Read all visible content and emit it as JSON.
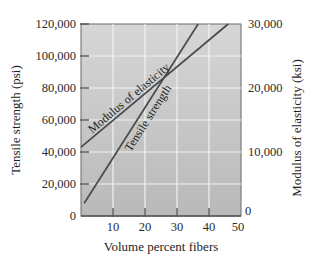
{
  "chart_data": {
    "type": "line",
    "title": "",
    "xlabel": "Volume percent fibers",
    "ylabel": "Tensile strength (psi)",
    "y2label": "Modulus of elasticity (ksi)",
    "xlim": [
      0,
      50
    ],
    "ylim": [
      0,
      120000
    ],
    "y2lim": [
      0,
      30000
    ],
    "x_ticks": [
      10,
      20,
      30,
      40,
      50
    ],
    "y_ticks": [
      0,
      20000,
      40000,
      60000,
      80000,
      100000,
      120000
    ],
    "y_tick_labels": [
      "0",
      "20,000",
      "40,000",
      "60,000",
      "80,000",
      "100,000",
      "120,000"
    ],
    "y2_ticks": [
      0,
      10000,
      20000,
      30000
    ],
    "y2_tick_labels": [
      "0",
      "10,000",
      "20,000",
      "30,000"
    ],
    "grid": true,
    "legend": "none (inline line labels)",
    "series": [
      {
        "name": "Tensile strength",
        "axis": "left",
        "unit": "psi",
        "x": [
          1,
          36.6
        ],
        "y": [
          8000,
          120000
        ]
      },
      {
        "name": "Modulus of elasticity",
        "axis": "right",
        "unit": "ksi",
        "x": [
          0,
          46
        ],
        "y": [
          10750,
          30000
        ]
      }
    ],
    "annotations": [
      {
        "text": "Modulus of elasticity",
        "along": "Modulus of elasticity"
      },
      {
        "text": "Tensile strength",
        "along": "Tensile strength"
      }
    ]
  },
  "style": {
    "plot_bg_top": "#d6d6d6",
    "plot_bg_bottom": "#b9b9b9",
    "grid_color": "#f2f2f2",
    "line_color": "#4a4a4a",
    "axis_color": "#555555"
  }
}
